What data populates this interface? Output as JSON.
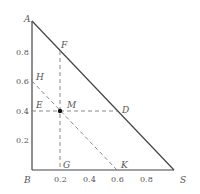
{
  "diagram": {
    "type": "ternary-phase-triangle",
    "points": {
      "A": {
        "label": "A",
        "x": 0,
        "y": 1.0
      },
      "B": {
        "label": "B",
        "x": 0,
        "y": 0
      },
      "S": {
        "label": "S",
        "x": 1.0,
        "y": 0
      },
      "F": {
        "label": "F",
        "x": 0.2,
        "y": 0.8
      },
      "H": {
        "label": "H",
        "x": 0,
        "y": 0.6
      },
      "E": {
        "label": "E",
        "x": 0,
        "y": 0.4
      },
      "M": {
        "label": "M",
        "x": 0.2,
        "y": 0.4
      },
      "D": {
        "label": "D",
        "x": 0.6,
        "y": 0.4
      },
      "G": {
        "label": "G",
        "x": 0.2,
        "y": 0
      },
      "K": {
        "label": "K",
        "x": 0.6,
        "y": 0
      }
    },
    "y_ticks": [
      "0.8",
      "0.6",
      "0.4",
      "0.2"
    ],
    "x_ticks": [
      "0.2",
      "0.4",
      "0.6",
      "0.8"
    ],
    "solid_lines": [
      "AB",
      "BS",
      "AS"
    ],
    "dashed_lines": [
      "FG",
      "ED",
      "HK"
    ],
    "colors": {
      "line": "#444444",
      "dashed": "#888888",
      "text": "#555555",
      "point": "#111111"
    }
  }
}
